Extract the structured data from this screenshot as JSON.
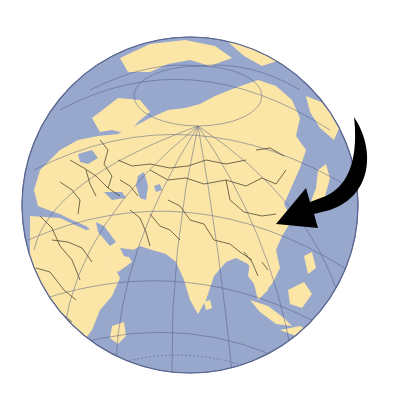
{
  "image": {
    "description": "Orthographic globe centered on Asia with a curved black arrow pointing at eastern China",
    "alt": "Globe showing Eurasia with arrow pointing to China"
  },
  "globe": {
    "center": [
      190,
      205
    ],
    "radius": 168,
    "colors": {
      "ocean": "#98a8cc",
      "land": "#fbe6a8",
      "border": "#3a3320",
      "graticule": "#4a5680",
      "background": "#ffffff"
    },
    "visible_regions": [
      "Arctic Ocean",
      "Europe",
      "Russia",
      "Middle East",
      "Africa (east)",
      "Central Asia",
      "China",
      "India",
      "Southeast Asia",
      "Indian Ocean",
      "Japan"
    ]
  },
  "arrow": {
    "color": "#000000",
    "points_to": "China",
    "direction": "curving down and left from the right edge"
  }
}
